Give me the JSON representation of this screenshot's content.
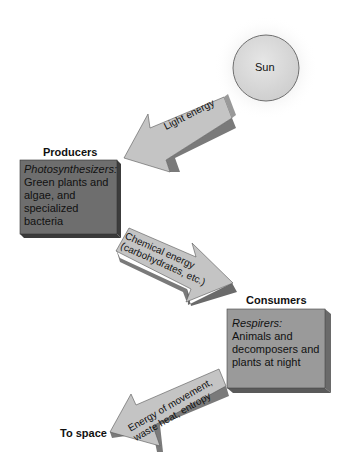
{
  "diagram": {
    "sun": {
      "label": "Sun"
    },
    "producers": {
      "title": "Producers",
      "subtitle": "Photosynthesizers:",
      "lines": [
        "Green plants and",
        "algae, and",
        "specialized",
        "bacteria"
      ]
    },
    "consumers": {
      "title": "Consumers",
      "subtitle": "Respirers:",
      "lines": [
        "Animals and",
        "decomposers and",
        "plants at night"
      ]
    },
    "arrows": {
      "light": {
        "lines": [
          "Light energy"
        ]
      },
      "chemical": {
        "lines": [
          "Chemical energy",
          "(carbohydrates, etc.)"
        ]
      },
      "waste": {
        "lines": [
          "Energy of movement,",
          "waste heat, entropy"
        ]
      }
    },
    "to_space": {
      "label": "To space"
    },
    "colors": {
      "producer_box": "#6e6e6e",
      "consumer_box": "#9a9a9a",
      "arrow_face": "#c2c2c2",
      "arrow_side": "#7a7a7a",
      "sun_fill": "#d9d9d9"
    }
  }
}
